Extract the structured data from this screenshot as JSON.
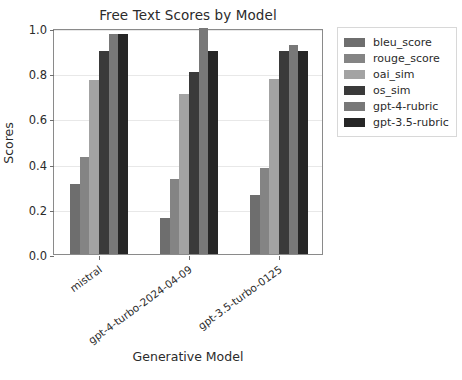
{
  "chart_data": {
    "type": "bar",
    "title": "Free Text Scores by Model",
    "xlabel": "Generative Model",
    "ylabel": "Scores",
    "categories": [
      "mistral",
      "gpt-4-turbo-2024-04-09",
      "gpt-3.5-turbo-0125"
    ],
    "series": [
      {
        "name": "bleu_score",
        "color": "#6e6e6e",
        "values": [
          0.31,
          0.16,
          0.26
        ]
      },
      {
        "name": "rouge_score",
        "color": "#848484",
        "values": [
          0.43,
          0.33,
          0.38
        ]
      },
      {
        "name": "oai_sim",
        "color": "#a3a3a3",
        "values": [
          0.77,
          0.71,
          0.775
        ]
      },
      {
        "name": "os_sim",
        "color": "#3a3a3a",
        "values": [
          0.9,
          0.805,
          0.9
        ]
      },
      {
        "name": "gpt-4-rubric",
        "color": "#787878",
        "values": [
          0.975,
          1.0,
          0.925
        ]
      },
      {
        "name": "gpt-3.5-rubric",
        "color": "#262626",
        "values": [
          0.975,
          0.9,
          0.9
        ]
      }
    ],
    "ylim": [
      0.0,
      1.0
    ],
    "yticks": [
      "0.0",
      "0.2",
      "0.4",
      "0.6",
      "0.8",
      "1.0"
    ],
    "ytick_values": [
      0.0,
      0.2,
      0.4,
      0.6,
      0.8,
      1.0
    ],
    "grid": true,
    "grid_axis": "y",
    "legend_position": "upper right outside",
    "xtick_rotation": -36,
    "background_color": "#ffffff",
    "axes_edge_color": "#8a8a8a"
  }
}
